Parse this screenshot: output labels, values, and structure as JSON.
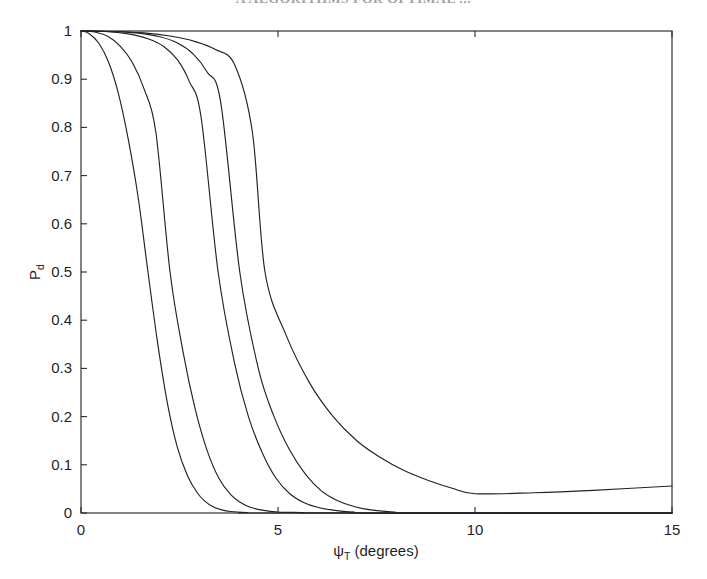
{
  "page": {
    "running_head": "A   ALGORITHMS   FOR   OPTIMAL   ...",
    "background": "#ffffff",
    "ink_color": "#222222"
  },
  "figure": {
    "name": "detection-probability-vs-tilt-angle"
  },
  "chart_data": {
    "type": "line",
    "title": "",
    "subtitle": "",
    "xlabel": "ψ",
    "xlabel_sub": "T",
    "xlabel_units": "(degrees)",
    "xlabel_full": "ψ_T (degrees)",
    "ylabel": "P",
    "ylabel_sub": "d",
    "ylabel_full": "P_d",
    "xlim": [
      0,
      15
    ],
    "ylim": [
      0,
      1
    ],
    "xticks": [
      0,
      5,
      10,
      15
    ],
    "xticklabels": [
      "0",
      "5",
      "10",
      "15"
    ],
    "yticks": [
      0,
      0.1,
      0.2,
      0.3,
      0.4,
      0.5,
      0.6,
      0.7,
      0.8,
      0.9,
      1
    ],
    "yticklabels": [
      "0",
      "0.1",
      "0.2",
      "0.3",
      "0.4",
      "0.5",
      "0.6",
      "0.7",
      "0.8",
      "0.9",
      "1"
    ],
    "grid": false,
    "legend": null,
    "legend_position": "none",
    "box": true,
    "series": [
      {
        "name": "curve-1",
        "color": "#222222",
        "x": [
          0.0,
          0.2,
          0.45,
          0.7,
          0.95,
          1.2,
          1.45,
          1.7,
          1.95,
          2.2,
          2.45,
          2.7,
          2.95,
          3.15,
          3.35,
          3.55,
          3.8,
          4.2,
          5.0,
          15.0
        ],
        "y": [
          1.0,
          0.995,
          0.975,
          0.935,
          0.87,
          0.775,
          0.655,
          0.5,
          0.35,
          0.225,
          0.135,
          0.078,
          0.042,
          0.024,
          0.013,
          0.007,
          0.003,
          0.001,
          0.0,
          0.0
        ]
      },
      {
        "name": "curve-2",
        "color": "#222222",
        "x": [
          0.0,
          0.35,
          0.7,
          1.0,
          1.3,
          1.6,
          1.9,
          2.26,
          2.6,
          2.9,
          3.2,
          3.5,
          3.8,
          4.05,
          4.3,
          4.6,
          5.0,
          5.6,
          6.5,
          15.0
        ],
        "y": [
          1.0,
          0.998,
          0.988,
          0.968,
          0.935,
          0.88,
          0.79,
          0.5,
          0.33,
          0.215,
          0.13,
          0.072,
          0.038,
          0.022,
          0.012,
          0.006,
          0.002,
          0.001,
          0.0,
          0.0
        ]
      },
      {
        "name": "curve-3",
        "color": "#222222",
        "x": [
          0.0,
          0.6,
          1.2,
          1.7,
          2.1,
          2.45,
          2.75,
          3.05,
          3.48,
          3.9,
          4.25,
          4.6,
          4.95,
          5.3,
          5.65,
          6.0,
          6.4,
          6.9,
          7.6,
          15.0
        ],
        "y": [
          1.0,
          0.999,
          0.994,
          0.984,
          0.968,
          0.94,
          0.895,
          0.82,
          0.5,
          0.31,
          0.2,
          0.125,
          0.072,
          0.04,
          0.022,
          0.012,
          0.006,
          0.002,
          0.0,
          0.0
        ]
      },
      {
        "name": "curve-4",
        "color": "#222222",
        "x": [
          0.0,
          0.7,
          1.4,
          2.0,
          2.45,
          2.85,
          3.2,
          3.55,
          4.03,
          4.5,
          4.9,
          5.3,
          5.7,
          6.1,
          6.5,
          6.95,
          7.4,
          7.95,
          8.7,
          15.0
        ],
        "y": [
          1.0,
          0.999,
          0.996,
          0.988,
          0.975,
          0.952,
          0.915,
          0.85,
          0.5,
          0.3,
          0.2,
          0.13,
          0.08,
          0.046,
          0.026,
          0.013,
          0.006,
          0.002,
          0.0,
          0.0
        ]
      },
      {
        "name": "curve-5",
        "color": "#222222",
        "x": [
          0.0,
          0.8,
          1.6,
          2.3,
          2.9,
          3.4,
          3.9,
          4.35,
          4.67,
          5.2,
          5.8,
          6.4,
          7.0,
          7.6,
          8.2,
          8.8,
          9.4,
          10.0,
          11.5,
          13.0,
          15.0
        ],
        "y": [
          1.0,
          0.999,
          0.996,
          0.989,
          0.978,
          0.962,
          0.93,
          0.79,
          0.5,
          0.37,
          0.27,
          0.2,
          0.15,
          0.115,
          0.088,
          0.068,
          0.052,
          0.04,
          0.042,
          0.047,
          0.056
        ]
      }
    ],
    "annotations": [
      {
        "name": "tail-minimum",
        "x": 10.0,
        "y": 0.04,
        "note": "rightmost curve reaches a shallow minimum near 10 degrees then rises slightly"
      }
    ],
    "geometry": {
      "plot_left_px": 81,
      "plot_right_px": 672,
      "plot_top_px": 31,
      "plot_bottom_px": 513
    }
  }
}
